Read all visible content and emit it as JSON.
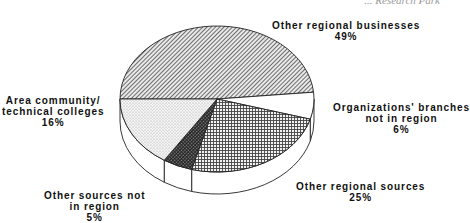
{
  "chart_data": {
    "type": "pie",
    "style": "3d-tilted",
    "title": "... Research Park",
    "title_visible_fragment": "Research Park",
    "categories": [
      "Other regional businesses",
      "Organizations' branches not in region",
      "Other regional sources",
      "Other sources not in region",
      "Area community/ technical colleges"
    ],
    "values": [
      49,
      6,
      25,
      5,
      16
    ],
    "unit": "%",
    "slices": [
      {
        "label_line1": "Other regional businesses",
        "label_line2": "",
        "value_text": "49%",
        "value": 49,
        "pattern": "diagonal-hatch"
      },
      {
        "label_line1": "Organizations' branches",
        "label_line2": "not in region",
        "value_text": "6%",
        "value": 6,
        "pattern": "white"
      },
      {
        "label_line1": "Other regional sources",
        "label_line2": "",
        "value_text": "25%",
        "value": 25,
        "pattern": "grid"
      },
      {
        "label_line1": "Other sources not",
        "label_line2": "in region",
        "value_text": "5%",
        "value": 5,
        "pattern": "dark-crosshatch"
      },
      {
        "label_line1": "Area community/",
        "label_line2": "technical colleges",
        "value_text": "16%",
        "value": 16,
        "pattern": "light-dots"
      }
    ],
    "legend": "none (direct labels)"
  }
}
